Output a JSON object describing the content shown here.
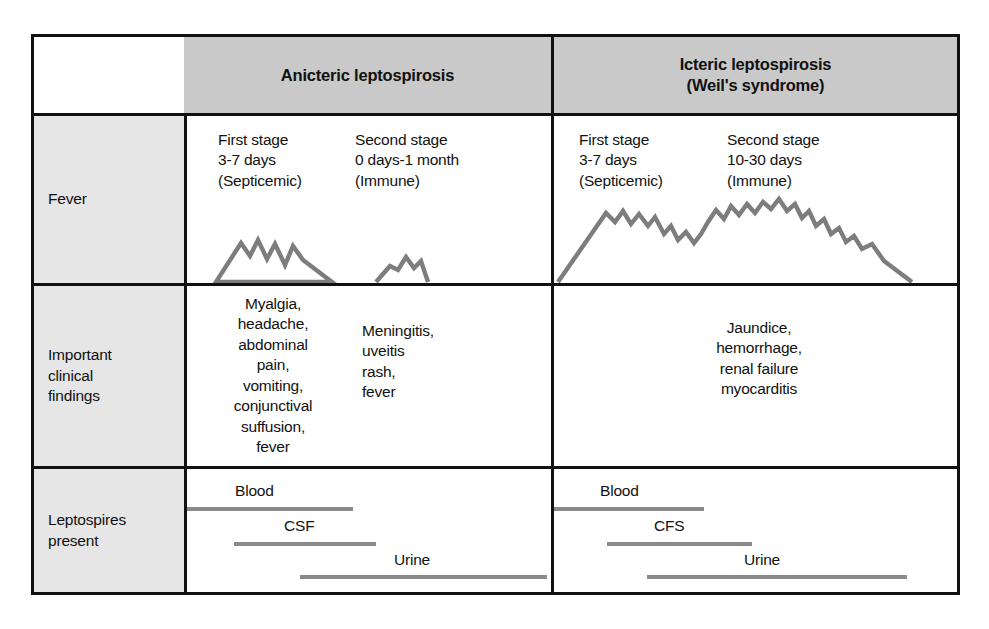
{
  "figure": {
    "type": "comparison-table",
    "title_present": false
  },
  "header": {
    "row_label_corner": "",
    "columns": [
      {
        "label": "Anicteric leptospirosis"
      },
      {
        "label": "Icteric leptospirosis\n(Weil's syndrome)"
      }
    ]
  },
  "rows": [
    {
      "label": "Fever"
    },
    {
      "label": "Important\nclinical\nfindings"
    },
    {
      "label": "Leptospires\npresent"
    }
  ],
  "fever": {
    "anicteric": {
      "stages": [
        {
          "name": "First stage",
          "duration": "3-7 days",
          "phase": "(Septicemic)"
        },
        {
          "name": "Second stage",
          "duration": "0 days-1 month",
          "phase": "(Immune)"
        }
      ],
      "stage_text": [
        "First stage\n3-7 days\n(Septicemic)",
        "Second stage\n0 days-1 month\n(Immune)"
      ],
      "curve_description": "Two separate saw-tooth febrile peaks: a tall first-stage spike followed by a gap, then a small second-stage bump"
    },
    "icteric": {
      "stages": [
        {
          "name": "First stage",
          "duration": "3-7 days",
          "phase": "(Septicemic)"
        },
        {
          "name": "Second stage",
          "duration": "10-30 days",
          "phase": "(Immune)"
        }
      ],
      "stage_text": [
        "First stage\n3-7 days\n(Septicemic)",
        "Second stage\n10-30 days\n(Immune)"
      ],
      "curve_description": "One continuous biphasic saw-tooth fever with no return to baseline between stages"
    }
  },
  "clinical_findings": {
    "anicteric_first_stage": "Myalgia,\nheadache,\nabdominal\npain,\nvomiting,\nconjunctival\nsuffusion,\nfever",
    "anicteric_second_stage": "Meningitis,\nuveitis\nrash,\nfever",
    "icteric": "Jaundice,\nhemorrhage,\nrenal failure\nmyocarditis"
  },
  "leptospires": {
    "anicteric": [
      {
        "label": "Blood"
      },
      {
        "label": "CSF"
      },
      {
        "label": "Urine"
      }
    ],
    "icteric": [
      {
        "label": "Blood"
      },
      {
        "label": "CFS"
      },
      {
        "label": "Urine"
      }
    ]
  },
  "colors": {
    "header_fill": "#c9c9c9",
    "row_label_fill": "#e6e6e6",
    "border": "#111111",
    "curve": "#7d7d7d",
    "bar": "#8a8a8a",
    "text": "#111111",
    "background": "#ffffff"
  }
}
